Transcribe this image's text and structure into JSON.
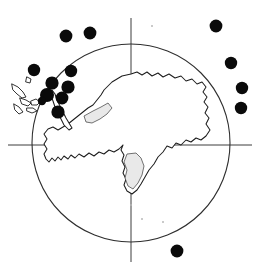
{
  "figure": {
    "projection": "polar stereographic",
    "background_color": "#ffffff",
    "width": 260,
    "height": 267
  },
  "colors": {
    "dot": "#0a0a0a",
    "coastline": "#1d1d1d",
    "graticule": "#3c3c3c",
    "circle": "#2e2e2e",
    "ice_shelf": "#e9e9e9"
  },
  "chart_data": {
    "type": "scatter",
    "xlabel": "",
    "ylabel": "",
    "grid": false,
    "legend": "none",
    "xlim": [
      0,
      260
    ],
    "ylim": [
      0,
      267
    ],
    "basemap": {
      "name": "Antarctica",
      "bounding_circle": {
        "cx": 131,
        "cy": 143,
        "r": 99
      },
      "axes": {
        "vertical_x": 131,
        "horizontal_y": 145,
        "vertical_extent": [
          18,
          262
        ],
        "horizontal_extent": [
          8,
          252
        ]
      }
    },
    "point_count": 15,
    "point_radius": 6.2,
    "points": [
      {
        "id": 1,
        "x": 66,
        "y": 36,
        "r": 6.4,
        "group": "outer-top"
      },
      {
        "id": 2,
        "x": 90,
        "y": 33,
        "r": 6.4,
        "group": "outer-top"
      },
      {
        "id": 3,
        "x": 34,
        "y": 70,
        "r": 6.2,
        "group": "peninsula-cluster"
      },
      {
        "id": 4,
        "x": 71,
        "y": 71,
        "r": 6.2,
        "group": "peninsula-cluster"
      },
      {
        "id": 5,
        "x": 52,
        "y": 83,
        "r": 6.6,
        "group": "peninsula-cluster"
      },
      {
        "id": 6,
        "x": 68,
        "y": 87,
        "r": 6.6,
        "group": "peninsula-cluster"
      },
      {
        "id": 7,
        "x": 47,
        "y": 95,
        "r": 7.0,
        "group": "peninsula-cluster"
      },
      {
        "id": 8,
        "x": 62,
        "y": 98,
        "r": 6.4,
        "group": "peninsula-cluster"
      },
      {
        "id": 9,
        "x": 58,
        "y": 112,
        "r": 6.6,
        "group": "peninsula-cluster"
      },
      {
        "id": 10,
        "x": 42,
        "y": 101,
        "r": 4.2,
        "group": "peninsula-cluster"
      },
      {
        "id": 11,
        "x": 216,
        "y": 26,
        "r": 6.4,
        "group": "right-margin"
      },
      {
        "id": 12,
        "x": 231,
        "y": 63,
        "r": 6.2,
        "group": "right-margin"
      },
      {
        "id": 13,
        "x": 242,
        "y": 88,
        "r": 6.2,
        "group": "right-margin"
      },
      {
        "id": 14,
        "x": 241,
        "y": 108,
        "r": 6.2,
        "group": "right-margin"
      },
      {
        "id": 15,
        "x": 177,
        "y": 251,
        "r": 6.4,
        "group": "outer-bottom"
      }
    ],
    "specks": [
      {
        "x": 152,
        "y": 26,
        "r": 1.0
      },
      {
        "x": 142,
        "y": 219,
        "r": 1.0
      },
      {
        "x": 163,
        "y": 222,
        "r": 1.0
      },
      {
        "x": 131,
        "y": 205,
        "r": 0.9
      }
    ]
  }
}
